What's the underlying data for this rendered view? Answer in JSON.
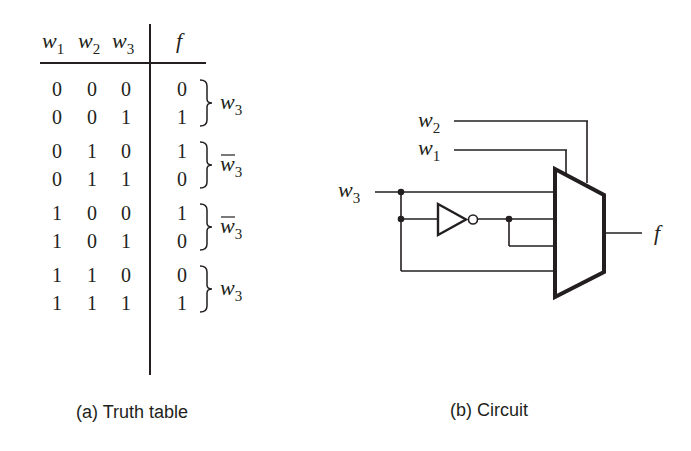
{
  "truth_table": {
    "headers": [
      {
        "var": "w",
        "sub": "1"
      },
      {
        "var": "w",
        "sub": "2"
      },
      {
        "var": "w",
        "sub": "3"
      },
      {
        "var": "f",
        "sub": ""
      }
    ],
    "rows": [
      [
        "0",
        "0",
        "0",
        "0"
      ],
      [
        "0",
        "0",
        "1",
        "1"
      ],
      [
        "0",
        "1",
        "0",
        "1"
      ],
      [
        "0",
        "1",
        "1",
        "0"
      ],
      [
        "1",
        "0",
        "0",
        "1"
      ],
      [
        "1",
        "0",
        "1",
        "0"
      ],
      [
        "1",
        "1",
        "0",
        "0"
      ],
      [
        "1",
        "1",
        "1",
        "1"
      ]
    ],
    "groups": [
      {
        "var": "w",
        "sub": "3",
        "complement": false
      },
      {
        "var": "w",
        "sub": "3",
        "complement": true
      },
      {
        "var": "w",
        "sub": "3",
        "complement": true
      },
      {
        "var": "w",
        "sub": "3",
        "complement": false
      }
    ],
    "caption": "(a) Truth table"
  },
  "circuit": {
    "inputs": [
      {
        "var": "w",
        "sub": "2"
      },
      {
        "var": "w",
        "sub": "1"
      },
      {
        "var": "w",
        "sub": "3"
      }
    ],
    "output": {
      "var": "f"
    },
    "caption": "(b) Circuit"
  }
}
